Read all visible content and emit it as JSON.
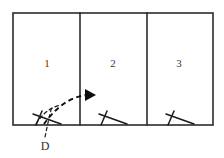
{
  "figure": {
    "type": "floor-plan-diagram",
    "background_color": "#ffffff",
    "line_color": "#2b2b2b",
    "accent_color": "#0d0d0d"
  },
  "outer_wall": {
    "label": "outer-wall",
    "x": 13,
    "y": 13,
    "width": 200,
    "height": 112
  },
  "partitions": [
    {
      "name": "partition-1-2",
      "x": 80,
      "y_top": 13,
      "y_bottom": 125
    },
    {
      "name": "partition-2-3",
      "x": 147,
      "y_top": 13,
      "y_bottom": 125
    }
  ],
  "rooms": [
    {
      "id": "room-1",
      "label": "1",
      "label_x": 47,
      "label_y": 63
    },
    {
      "id": "room-2",
      "label": "2",
      "label_x": 113,
      "label_y": 63
    },
    {
      "id": "room-3",
      "label": "3",
      "label_x": 179,
      "label_y": 63
    }
  ],
  "doors": [
    {
      "id": "door-1",
      "room": "room-1",
      "label": "D",
      "hinge_x": 36,
      "hinge_y": 125,
      "leaf_end_x": 60,
      "leaf_end_y": 119,
      "tick_end_x": 42,
      "tick_end_y": 112,
      "has_swing_arc": true
    },
    {
      "id": "door-2",
      "room": "room-2",
      "label": "",
      "hinge_x": 102,
      "hinge_y": 125,
      "leaf_end_x": 126,
      "leaf_end_y": 119,
      "tick_end_x": 108,
      "tick_end_y": 112,
      "has_swing_arc": false
    },
    {
      "id": "door-3",
      "room": "room-3",
      "label": "",
      "hinge_x": 169,
      "hinge_y": 125,
      "leaf_end_x": 193,
      "leaf_end_y": 119,
      "tick_end_x": 175,
      "tick_end_y": 112,
      "has_swing_arc": false
    }
  ],
  "door_label": {
    "text": "D",
    "x": 45,
    "y": 146
  },
  "motion_arrow": {
    "name": "swing-direction-arrow",
    "start_x": 43,
    "start_y": 128,
    "end_x": 88,
    "end_y": 95,
    "arrow_tip_x": 95,
    "arrow_tip_y": 95,
    "style": "dashed-curved-with-solid-arrowhead"
  }
}
